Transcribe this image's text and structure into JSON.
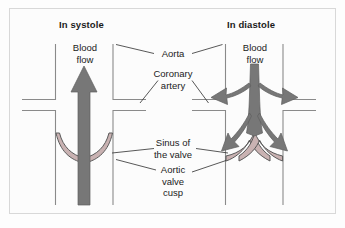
{
  "figure": {
    "type": "anatomical-diagram",
    "panels": [
      {
        "id": "systole",
        "title": "In systole",
        "flow_label_line1": "Blood",
        "flow_label_line2": "flow"
      },
      {
        "id": "diastole",
        "title": "In diastole",
        "flow_label_line1": "Blood",
        "flow_label_line2": "flow"
      }
    ],
    "annotations": [
      {
        "id": "aorta",
        "lines": [
          "Aorta"
        ]
      },
      {
        "id": "coronary-artery",
        "lines": [
          "Coronary",
          "artery"
        ]
      },
      {
        "id": "sinus-of-valve",
        "lines": [
          "Sinus of",
          "the valve"
        ]
      },
      {
        "id": "aortic-valve-cusp",
        "lines": [
          "Aortic",
          "valve",
          "cusp"
        ]
      }
    ],
    "colors": {
      "arrow": "#777777",
      "arrow_edge": "#5f5f5f",
      "vessel_wall": "#8a8a8a",
      "cusp_fill": "#c9b2b2",
      "cusp_edge": "#5a5a5a",
      "leader_line": "#3a3a3a",
      "frame": "#d8d8d8",
      "background": "#fcfcfc",
      "text": "#1b1b1b"
    }
  }
}
